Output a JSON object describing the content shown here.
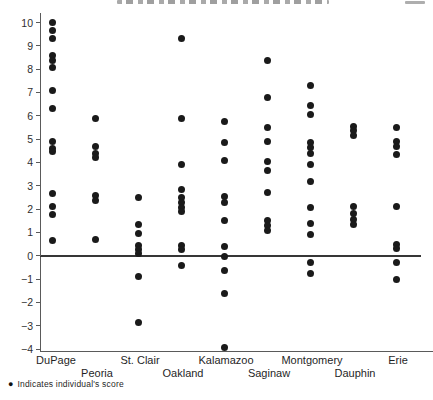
{
  "colors": {
    "dot": "#1a1a1a",
    "axis": "#5a5a5a",
    "zero_line": "#363636",
    "text": "#222222"
  },
  "legend": {
    "marker": "●",
    "label": "Indicates individual's score"
  },
  "chart_data": {
    "type": "scatter",
    "title": "",
    "xlabel": "",
    "ylabel": "",
    "ylim": [
      -4,
      10
    ],
    "yticks": [
      10,
      9,
      8,
      7,
      6,
      5,
      4,
      3,
      2,
      1,
      0,
      -1,
      -2,
      -3,
      -4
    ],
    "zero_line_y": 0,
    "grid": false,
    "legend_position": "bottom-left",
    "categories": [
      "DuPage",
      "Peoria",
      "St. Clair",
      "Oakland",
      "Kalamazoo",
      "Saginaw",
      "Montgomery",
      "Dauphin",
      "Erie"
    ],
    "category_label_row": [
      1,
      2,
      1,
      2,
      1,
      2,
      1,
      2,
      1
    ],
    "series": [
      {
        "name": "individual scores",
        "groups": [
          {
            "label": "DuPage",
            "values": [
              10.0,
              9.65,
              9.3,
              8.6,
              8.35,
              8.05,
              7.1,
              6.3,
              4.9,
              4.6,
              4.45,
              2.65,
              2.1,
              1.75,
              0.65
            ]
          },
          {
            "label": "Peoria",
            "values": [
              5.9,
              4.7,
              4.4,
              4.2,
              2.6,
              2.35,
              0.7
            ]
          },
          {
            "label": "St. Clair",
            "values": [
              2.5,
              1.35,
              0.95,
              0.45,
              0.25,
              0.1,
              -0.9,
              -2.85
            ]
          },
          {
            "label": "Oakland",
            "values": [
              9.3,
              5.9,
              3.9,
              2.85,
              2.5,
              2.3,
              2.05,
              1.9,
              0.45,
              0.25,
              -0.4
            ]
          },
          {
            "label": "Kalamazoo",
            "values": [
              5.75,
              4.85,
              4.1,
              2.55,
              2.3,
              1.5,
              0.4,
              -0.05,
              -0.65,
              -1.6,
              -3.95
            ]
          },
          {
            "label": "Saginaw",
            "values": [
              8.35,
              6.8,
              5.5,
              4.9,
              4.05,
              3.65,
              2.7,
              1.5,
              1.3,
              1.1
            ]
          },
          {
            "label": "Montgomery",
            "values": [
              7.3,
              6.45,
              6.05,
              4.85,
              4.65,
              4.4,
              3.9,
              3.2,
              2.05,
              1.4,
              0.9,
              -0.3,
              -0.75
            ]
          },
          {
            "label": "Dauphin",
            "values": [
              5.55,
              5.35,
              5.15,
              2.1,
              1.8,
              1.55,
              1.35
            ]
          },
          {
            "label": "Erie",
            "values": [
              5.5,
              4.9,
              4.7,
              4.35,
              2.1,
              0.5,
              0.3,
              -0.3,
              -1.0
            ]
          }
        ]
      }
    ]
  }
}
